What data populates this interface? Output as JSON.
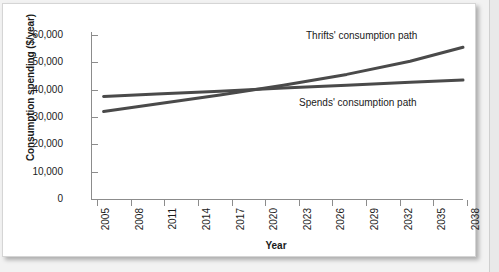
{
  "chart_data": {
    "type": "line",
    "title": "",
    "xlabel": "Year",
    "ylabel": "Consumption spending ($/year)",
    "xlim": [
      2005,
      2040
    ],
    "ylim": [
      0,
      60000
    ],
    "grid": false,
    "legend_position": "inline-annotations",
    "x_tick_labels": [
      "2005",
      "2008",
      "2011",
      "2014",
      "2017",
      "2020",
      "2023",
      "2026",
      "2029",
      "2032",
      "2035",
      "2038"
    ],
    "y_tick_labels": [
      "0",
      "10,000",
      "20,000",
      "30,000",
      "40,000",
      "50,000",
      "60,000"
    ],
    "y_tick_values": [
      0,
      10000,
      20000,
      30000,
      40000,
      50000,
      60000
    ],
    "series": [
      {
        "name": "Thrifts' consumption path",
        "color": "#4a4a4a",
        "annotation": "Thrifts' consumption path",
        "x": [
          2006,
          2011,
          2017,
          2023,
          2029,
          2035,
          2040
        ],
        "values": [
          32000,
          34800,
          38000,
          41600,
          45600,
          50400,
          55500
        ]
      },
      {
        "name": "Spends' consumption path",
        "color": "#4a4a4a",
        "annotation": "Spends' consumption path",
        "x": [
          2006,
          2011,
          2017,
          2023,
          2029,
          2035,
          2040
        ],
        "values": [
          37500,
          38400,
          39400,
          40600,
          41600,
          42700,
          43500
        ]
      }
    ],
    "crossover": {
      "year": 2021,
      "value": 40000
    }
  },
  "axes": {
    "y_title": "Consumption spending ($/year)",
    "x_title": "Year",
    "y_ticks": [
      {
        "label": "60,000",
        "value": 60000
      },
      {
        "label": "50,000",
        "value": 50000
      },
      {
        "label": "40,000",
        "value": 40000
      },
      {
        "label": "30,000",
        "value": 30000
      },
      {
        "label": "20,000",
        "value": 20000
      },
      {
        "label": "10,000",
        "value": 10000
      },
      {
        "label": "0",
        "value": 0
      }
    ],
    "x_ticks": [
      {
        "label": "2005"
      },
      {
        "label": "2008"
      },
      {
        "label": "2011"
      },
      {
        "label": "2014"
      },
      {
        "label": "2017"
      },
      {
        "label": "2020"
      },
      {
        "label": "2023"
      },
      {
        "label": "2026"
      },
      {
        "label": "2029"
      },
      {
        "label": "2032"
      },
      {
        "label": "2035"
      },
      {
        "label": "2038"
      }
    ]
  },
  "annotations": {
    "thrifts": "Thrifts' consumption path",
    "spends": "Spends' consumption path"
  },
  "colors": {
    "line": "#4a4a4a",
    "axis": "#8c8c8c",
    "text": "#1a1a1a",
    "card_background": "#ffffff",
    "page_background": "#f2f2f2"
  }
}
